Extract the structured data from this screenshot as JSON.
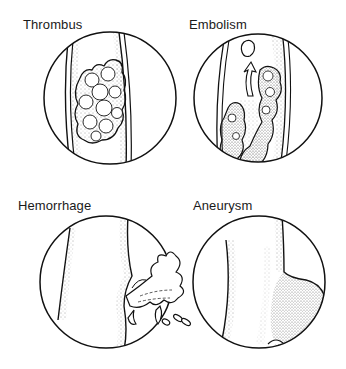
{
  "panels": [
    {
      "id": "thrombus",
      "label": "Thrombus",
      "label_x": 23,
      "label_y": 17,
      "circle": {
        "cx": 110,
        "cy": 98,
        "r": 66
      }
    },
    {
      "id": "embolism",
      "label": "Embolism",
      "label_x": 189,
      "label_y": 17,
      "circle": {
        "cx": 258,
        "cy": 98,
        "r": 64
      }
    },
    {
      "id": "hemorrhage",
      "label": "Hemorrhage",
      "label_x": 18,
      "label_y": 198,
      "circle": {
        "cx": 106,
        "cy": 282,
        "r": 66
      }
    },
    {
      "id": "aneurysm",
      "label": "Aneurysm",
      "label_x": 193,
      "label_y": 198,
      "circle": {
        "cx": 259,
        "cy": 282,
        "r": 66
      }
    }
  ],
  "colors": {
    "ink": "#111111",
    "background": "#ffffff",
    "stipple": "#555555"
  }
}
